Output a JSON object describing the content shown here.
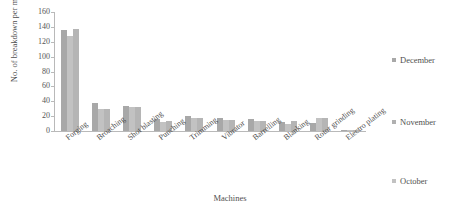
{
  "chart_data": {
    "type": "bar",
    "title": "",
    "xlabel": "Machines",
    "ylabel": "No. of breakdown per month",
    "ylim": [
      0,
      160
    ],
    "ytick_step": 20,
    "yticks": [
      0,
      20,
      40,
      60,
      80,
      100,
      120,
      140,
      160
    ],
    "grid": false,
    "legend_position": "right",
    "categories": [
      "Forging",
      "Broaching",
      "Shot blasting",
      "Punching",
      "Trimming",
      "Vibrator",
      "Barrelling",
      "Blanking",
      "Rotor grinding",
      "Electro plating"
    ],
    "series": [
      {
        "name": "December",
        "color": "#a8a8a8",
        "values": [
          136,
          37,
          33,
          16,
          20,
          17,
          16,
          12,
          11,
          2
        ]
      },
      {
        "name": "November",
        "color": "#c2c2c2",
        "values": [
          128,
          30,
          32,
          12,
          17,
          15,
          14,
          10,
          18,
          1
        ]
      },
      {
        "name": "October",
        "color": "#b5b5b5",
        "values": [
          137,
          30,
          32,
          14,
          17,
          15,
          14,
          14,
          18,
          1
        ]
      }
    ]
  },
  "legend": {
    "items": [
      {
        "label": "December",
        "color": "#a8a8a8"
      },
      {
        "label": "November",
        "color": "#b0b0b0"
      },
      {
        "label": "October",
        "color": "#c2c2c2"
      }
    ]
  }
}
